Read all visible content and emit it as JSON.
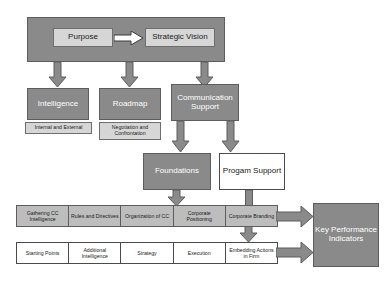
{
  "diagram": {
    "colors": {
      "fill_gray": "#8a8a8a",
      "fill_light": "#d6d6d6",
      "fill_cell": "#bdbdbd",
      "fill_white": "#ffffff",
      "stroke": "#5d5d5d",
      "arrow_fill": "#8a8a8a",
      "text_light": "#ffffff",
      "text_dark": "#1a1a1a"
    },
    "top": {
      "purpose": "Purpose",
      "strategic_vision": "Strategic Vision",
      "connector_icon": "right-arrow-icon"
    },
    "tier2": [
      {
        "label": "Intelligence",
        "sub": "Internal and External"
      },
      {
        "label": "Roadmap",
        "sub": "Negotiation and Confrontation"
      },
      {
        "label": "Communication Support",
        "sub": ""
      }
    ],
    "tier3": [
      {
        "label": "Foundations",
        "style": "gray"
      },
      {
        "label": "Progam Support",
        "style": "white"
      }
    ],
    "bar_top": [
      "Gathering CC Intelligence",
      "Rules and Directives",
      "Organization of CC",
      "Corporate Positioning",
      "Corporate Branding"
    ],
    "bar_bottom": [
      "Starting Points",
      "Additional Intelligence",
      "Strategy",
      "Execution",
      "Embedding Actions in Firm"
    ],
    "outcome": "Key Performance Indicators"
  }
}
